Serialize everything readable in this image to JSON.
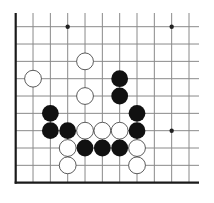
{
  "board": {
    "description": "Go board lower-left corner diagram",
    "grid": {
      "origin_x": 15.7,
      "origin_y": 26.7,
      "spacing": 17.33,
      "cols": 11,
      "rows": 10,
      "top_open_y": 13,
      "right_open_x": 199,
      "line_color": "#8a8a8a",
      "border_color": "#1a1a1a"
    },
    "star_points": [
      {
        "col": 3,
        "row": 0
      },
      {
        "col": 9,
        "row": 0
      },
      {
        "col": 9,
        "row": 6
      }
    ],
    "stones": [
      {
        "color": "white",
        "col": 4,
        "row": 2
      },
      {
        "color": "white",
        "col": 1,
        "row": 3
      },
      {
        "color": "black",
        "col": 6,
        "row": 3
      },
      {
        "color": "white",
        "col": 4,
        "row": 4
      },
      {
        "color": "black",
        "col": 6,
        "row": 4
      },
      {
        "color": "black",
        "col": 2,
        "row": 5
      },
      {
        "color": "black",
        "col": 7,
        "row": 5
      },
      {
        "color": "black",
        "col": 2,
        "row": 6
      },
      {
        "color": "black",
        "col": 3,
        "row": 6
      },
      {
        "color": "white",
        "col": 4,
        "row": 6
      },
      {
        "color": "white",
        "col": 5,
        "row": 6
      },
      {
        "color": "white",
        "col": 6,
        "row": 6
      },
      {
        "color": "black",
        "col": 7,
        "row": 6
      },
      {
        "color": "white",
        "col": 3,
        "row": 7
      },
      {
        "color": "black",
        "col": 4,
        "row": 7
      },
      {
        "color": "black",
        "col": 5,
        "row": 7
      },
      {
        "color": "black",
        "col": 6,
        "row": 7
      },
      {
        "color": "white",
        "col": 7,
        "row": 7
      },
      {
        "color": "white",
        "col": 3,
        "row": 8
      },
      {
        "color": "white",
        "col": 7,
        "row": 8
      }
    ],
    "colors": {
      "black_stone": "#111111",
      "white_stone": "#ffffff",
      "white_stone_outline": "#333333"
    }
  }
}
